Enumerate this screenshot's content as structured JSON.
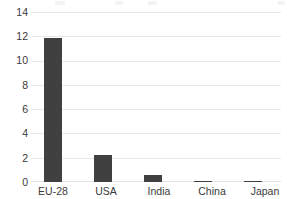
{
  "chart_data": {
    "type": "bar",
    "title": "",
    "xlabel": "",
    "ylabel": "",
    "categories": [
      "EU-28",
      "USA",
      "India",
      "China",
      "Japan"
    ],
    "values": [
      11.9,
      2.2,
      0.6,
      0.1,
      0.05
    ],
    "series": [
      {
        "name": "",
        "values": [
          11.9,
          2.2,
          0.6,
          0.1,
          0.05
        ]
      }
    ],
    "ylim": [
      0,
      14
    ],
    "yticks": [
      0,
      2,
      4,
      6,
      8,
      10,
      12,
      14
    ],
    "ytick_labels": [
      "0",
      "2",
      "4",
      "6",
      "8",
      "10",
      "12",
      "14"
    ],
    "grid": true,
    "grid_axis": "y",
    "legend": false,
    "legend_position": "none",
    "bar_color": "#404040",
    "gridline_color": "#e9e9ec",
    "axis_text_color": "#3a3a3a",
    "background_color": "#ffffff"
  },
  "axes": {
    "y_tick_labels": [
      "14",
      "12",
      "10",
      "8",
      "6",
      "4",
      "2",
      "0"
    ],
    "x_tick_labels": [
      "EU-28",
      "USA",
      "India",
      "China",
      "Japan"
    ]
  },
  "icons": {
    "bar_glyph": "bar-column"
  }
}
